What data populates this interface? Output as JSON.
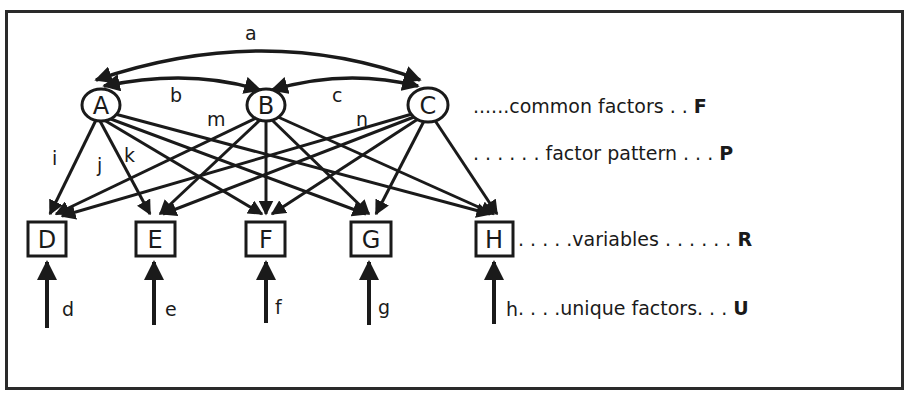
{
  "diagram": {
    "type": "factor-analysis-path-diagram",
    "common_factors": [
      {
        "id": "A",
        "label": "A",
        "x": 101,
        "y": 105
      },
      {
        "id": "B",
        "label": "B",
        "x": 266,
        "y": 105
      },
      {
        "id": "C",
        "label": "C",
        "x": 428,
        "y": 105
      }
    ],
    "variables": [
      {
        "id": "D",
        "label": "D",
        "x": 47
      },
      {
        "id": "E",
        "label": "E",
        "x": 155
      },
      {
        "id": "F",
        "label": "F",
        "x": 266
      },
      {
        "id": "G",
        "label": "G",
        "x": 371
      },
      {
        "id": "H",
        "label": "H",
        "x": 494
      }
    ],
    "factor_correlations": [
      {
        "from": "A",
        "to": "C",
        "label": "a"
      },
      {
        "from": "A",
        "to": "B",
        "label": "b"
      },
      {
        "from": "B",
        "to": "C",
        "label": "c"
      }
    ],
    "loading_labels": [
      "i",
      "j",
      "k",
      "m",
      "n"
    ],
    "unique_factors": [
      {
        "to": "D",
        "label": "d"
      },
      {
        "to": "E",
        "label": "e"
      },
      {
        "to": "F",
        "label": "f"
      },
      {
        "to": "G",
        "label": "g"
      },
      {
        "to": "H",
        "label": "h"
      }
    ]
  },
  "legend": {
    "common": {
      "text": "......common factors . . ",
      "symbol": "F"
    },
    "pattern": {
      "text": ". . . . . . factor pattern . . . ",
      "symbol": "P"
    },
    "variables": {
      "text": ". . . . .variables . . . . . . ",
      "symbol": "R"
    },
    "unique": {
      "text": ". . . .unique factors. . . ",
      "symbol": "U"
    }
  }
}
